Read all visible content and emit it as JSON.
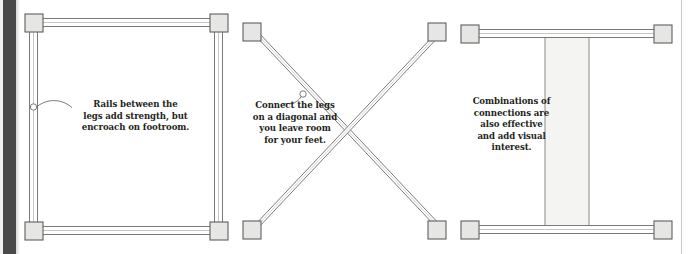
{
  "figure": {
    "type": "instructional-diagram",
    "panel_count": 3,
    "background_color": "#ffffff",
    "ink_color": "#231f20",
    "part_fill_color": "#e8e8e6",
    "part_outline_color": "#5a5a5a",
    "gutter_color": "#4a4a4a"
  },
  "panels": [
    {
      "id": "panel-rails",
      "name": "rails-between-legs",
      "layout": "rectangular frame with four corner legs and four connecting rails",
      "caption": "Rails between the\nlegs add strength, but\nencroach on footroom.",
      "callout_marker": "circle",
      "legs": [
        {
          "name": "leg-top-left",
          "x": 25,
          "y": 14,
          "w": 18,
          "h": 18
        },
        {
          "name": "leg-top-right",
          "x": 210,
          "y": 14,
          "w": 18,
          "h": 18
        },
        {
          "name": "leg-bottom-left",
          "x": 25,
          "y": 222,
          "w": 18,
          "h": 18
        },
        {
          "name": "leg-bottom-right",
          "x": 210,
          "y": 222,
          "w": 18,
          "h": 18
        }
      ],
      "rails": [
        {
          "name": "rail-top",
          "orientation": "horizontal"
        },
        {
          "name": "rail-bottom",
          "orientation": "horizontal"
        },
        {
          "name": "rail-left",
          "orientation": "vertical"
        },
        {
          "name": "rail-right",
          "orientation": "vertical"
        }
      ]
    },
    {
      "id": "panel-diagonal",
      "name": "diagonal-cross-brace",
      "layout": "X shaped pair of diagonal stretchers joining four corner legs",
      "caption": "Connect the legs\non a diagonal and\nyou leave room\nfor your feet.",
      "callout_marker": "circle",
      "legs": [
        {
          "name": "leg-top-left",
          "x": 243,
          "y": 23,
          "w": 18,
          "h": 18
        },
        {
          "name": "leg-top-right",
          "x": 428,
          "y": 23,
          "w": 18,
          "h": 18
        },
        {
          "name": "leg-bottom-left",
          "x": 243,
          "y": 221,
          "w": 18,
          "h": 18
        },
        {
          "name": "leg-bottom-right",
          "x": 428,
          "y": 221,
          "w": 18,
          "h": 18
        }
      ],
      "rails": [
        {
          "name": "diagonal-brace-nw-se",
          "orientation": "diagonal"
        },
        {
          "name": "diagonal-brace-ne-sw",
          "orientation": "diagonal"
        }
      ]
    },
    {
      "id": "panel-combination",
      "name": "combination-connections",
      "layout": "top and bottom rails plus a wide central vertical panel forming an H",
      "caption": "Combinations of\nconnections are\nalso effective\nand add visual\ninterest.",
      "callout_marker": "none",
      "legs": [
        {
          "name": "leg-top-left",
          "x": 461,
          "y": 25,
          "w": 18,
          "h": 18
        },
        {
          "name": "leg-top-right",
          "x": 654,
          "y": 25,
          "w": 18,
          "h": 18
        },
        {
          "name": "leg-bottom-left",
          "x": 461,
          "y": 221,
          "w": 18,
          "h": 18
        },
        {
          "name": "leg-bottom-right",
          "x": 654,
          "y": 221,
          "w": 18,
          "h": 18
        }
      ],
      "rails": [
        {
          "name": "rail-top",
          "orientation": "horizontal"
        },
        {
          "name": "rail-bottom",
          "orientation": "horizontal"
        },
        {
          "name": "center-panel",
          "orientation": "vertical",
          "x": 545,
          "w": 44
        }
      ]
    }
  ]
}
